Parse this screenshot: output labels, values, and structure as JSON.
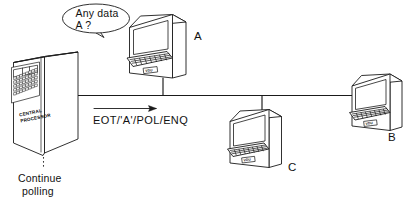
{
  "diagram": {
    "type": "network-polling-diagram",
    "background_color": "#ffffff",
    "line_color": "#1a1a1a"
  },
  "central_processor": {
    "label_line1": "CENTRAL",
    "label_line2": "PROCESSOR",
    "panel_name": "operator-control-panel"
  },
  "speech_bubble": {
    "line1": "Any data",
    "line2": "A ?"
  },
  "bus": {
    "protocol_label": "EOT/'A'/POL/ENQ",
    "arrow_direction": "right"
  },
  "note": {
    "line1": "Continue",
    "line2": "polling"
  },
  "terminals": [
    {
      "id": "A",
      "label": "A",
      "name": "terminal-a",
      "badge": "VDU"
    },
    {
      "id": "B",
      "label": "B",
      "name": "terminal-b",
      "badge": "VDU"
    },
    {
      "id": "C",
      "label": "C",
      "name": "terminal-c",
      "badge": "VDU"
    }
  ]
}
